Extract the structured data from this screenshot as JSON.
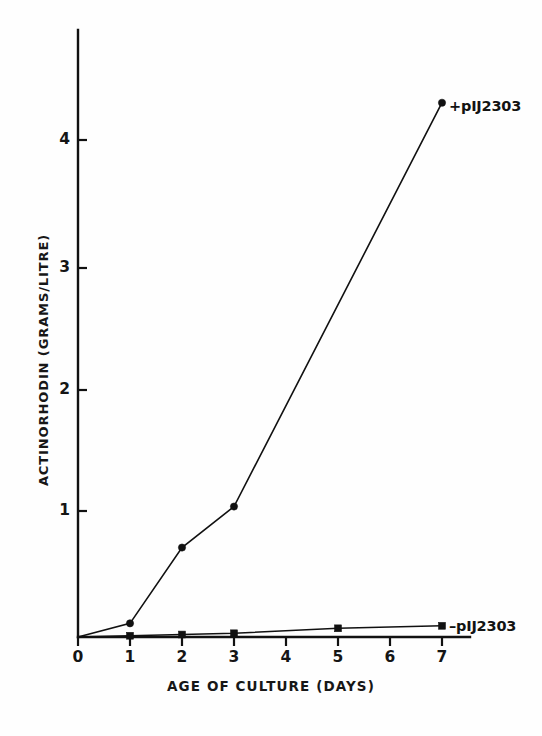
{
  "figure": {
    "background_color": "#fefefe",
    "ink_color": "#111111"
  },
  "axes": {
    "x_title": "AGE OF CULTURE (DAYS)",
    "y_title": "ACTINORHODIN (GRAMS/LITRE)",
    "x_ticks": [
      "0",
      "1",
      "2",
      "3",
      "4",
      "5",
      "6",
      "7"
    ],
    "y_ticks": [
      "1",
      "2",
      "3",
      "4"
    ]
  },
  "labels": {
    "upper_series": "+pIJ2303",
    "lower_series": "–pIJ2303"
  },
  "chart_data": {
    "type": "line",
    "title": "",
    "xlabel": "AGE OF CULTURE (DAYS)",
    "ylabel": "ACTINORHODIN (GRAMS/LITRE)",
    "xlim": [
      0,
      7.55
    ],
    "ylim": [
      0,
      4.95
    ],
    "xticks": [
      0,
      1,
      2,
      3,
      4,
      5,
      6,
      7
    ],
    "yticks": [
      1,
      2,
      3,
      4
    ],
    "grid": false,
    "legend_position": "inline-right-of-last-point",
    "series": [
      {
        "name": "+pIJ2303",
        "marker": "circle",
        "x": [
          0,
          1,
          2,
          3,
          7
        ],
        "values": [
          0.0,
          0.11,
          0.72,
          1.05,
          4.3
        ]
      },
      {
        "name": "–pIJ2303",
        "marker": "square",
        "x": [
          0,
          1,
          2,
          3,
          5,
          7
        ],
        "values": [
          0.0,
          0.01,
          0.02,
          0.03,
          0.07,
          0.09
        ]
      }
    ],
    "annotations": [
      {
        "text": "+pIJ2303",
        "at_x": 7,
        "at_y": 4.3
      },
      {
        "text": "–pIJ2303",
        "at_x": 7,
        "at_y": 0.09
      }
    ]
  }
}
